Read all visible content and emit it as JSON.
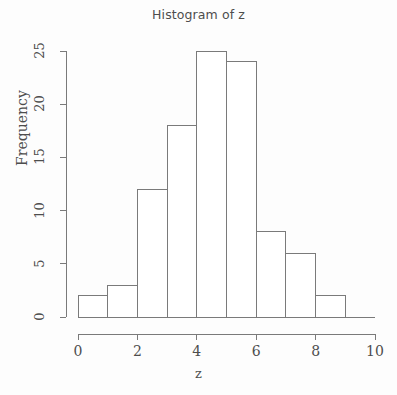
{
  "chart_data": {
    "type": "bar",
    "title": "Histogram of z",
    "xlabel": "z",
    "ylabel": "Frequency",
    "categories": [
      "0-1",
      "1-2",
      "2-3",
      "3-4",
      "4-5",
      "5-6",
      "6-7",
      "7-8",
      "8-9"
    ],
    "bin_edges": [
      0,
      1,
      2,
      3,
      4,
      5,
      6,
      7,
      8,
      9
    ],
    "values": [
      2,
      3,
      12,
      18,
      25,
      24,
      8,
      6,
      2
    ],
    "xlim": [
      0,
      10
    ],
    "ylim": [
      0,
      25
    ],
    "xticks": [
      "0",
      "2",
      "4",
      "6",
      "8",
      "10"
    ],
    "xtick_values": [
      0,
      2,
      4,
      6,
      8,
      10
    ],
    "yticks": [
      "0",
      "5",
      "10",
      "15",
      "20",
      "25"
    ],
    "ytick_values": [
      0,
      5,
      10,
      15,
      20,
      25
    ],
    "grid": false,
    "legend": false,
    "bar_fill_color": "#ffffff",
    "bar_border_color": "#7a7a7a",
    "axis_color": "#7a7a7a",
    "text_color": "#4d4d4d",
    "background_color": "#fdfdfd"
  }
}
